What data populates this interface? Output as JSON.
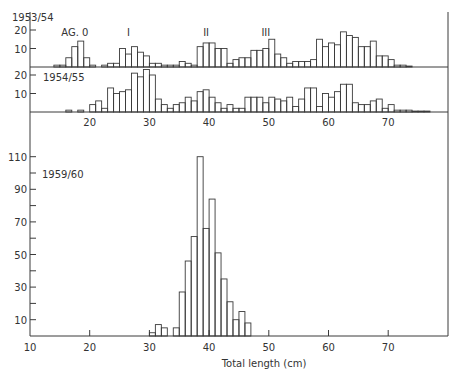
{
  "figure": {
    "xlabel": "Total length (cm)",
    "x_ticks": [
      10,
      20,
      30,
      40,
      50,
      60,
      70
    ],
    "colors": {
      "ink": "#3a3a3a",
      "background": "#ffffff"
    }
  },
  "chart_data": [
    {
      "type": "bar",
      "title": "1953/54",
      "panel_label": "1953/54",
      "annotations": [
        {
          "text": "AG. 0",
          "x": 17
        },
        {
          "text": "I",
          "x": 26
        },
        {
          "text": "II",
          "x": 39
        },
        {
          "text": "III",
          "x": 49
        }
      ],
      "xlabel": "Total length (cm)",
      "ylabel": "",
      "y_ticks": [
        10,
        20
      ],
      "ylim": [
        0,
        22
      ],
      "xlim": [
        10,
        80
      ],
      "bin_start": 14,
      "bin_width": 1,
      "values": [
        1,
        1,
        5,
        11,
        14,
        5,
        1,
        0,
        1,
        2,
        2,
        10,
        7,
        11,
        8,
        6,
        2,
        2,
        1,
        1,
        1,
        3,
        2,
        1,
        11,
        13,
        13,
        10,
        10,
        2,
        4,
        5,
        5,
        9,
        9,
        10,
        15,
        7,
        5,
        2,
        3,
        3,
        3,
        4,
        15,
        11,
        13,
        12,
        19,
        17,
        16,
        11,
        11,
        14,
        6,
        6,
        4,
        1,
        1,
        0.5
      ],
      "grid": false
    },
    {
      "type": "bar",
      "title": "1954/55",
      "panel_label": "1954/55",
      "xlabel": "Total length (cm)",
      "ylabel": "",
      "y_ticks": [
        10,
        20
      ],
      "ylim": [
        0,
        22
      ],
      "xlim": [
        10,
        80
      ],
      "bin_start": 16,
      "bin_width": 1,
      "values": [
        1,
        0,
        1,
        0,
        4,
        6,
        2,
        13,
        10,
        11,
        12,
        21,
        19,
        23,
        20,
        7,
        4,
        2,
        4,
        5,
        8,
        6,
        11,
        12,
        8,
        5,
        2,
        4,
        2,
        2,
        8,
        8,
        8,
        5,
        8,
        7,
        6,
        8,
        3,
        7,
        13,
        13,
        3,
        10,
        8,
        11,
        15,
        15,
        5,
        4,
        4,
        6,
        7,
        2,
        4,
        1,
        1,
        1,
        0.5,
        0.5,
        0.5
      ],
      "grid": false
    },
    {
      "type": "bar",
      "title": "1959/60",
      "panel_label": "1959/60",
      "xlabel": "Total length (cm)",
      "ylabel": "",
      "y_ticks": [
        10,
        30,
        50,
        70,
        90,
        110
      ],
      "ylim": [
        0,
        112
      ],
      "xlim": [
        10,
        80
      ],
      "bin_start": 30,
      "bin_width": 1,
      "values": [
        2,
        7,
        5,
        0,
        5,
        27,
        46,
        61,
        110,
        66,
        84,
        51,
        35,
        21,
        10,
        15,
        8
      ],
      "grid": false
    }
  ]
}
